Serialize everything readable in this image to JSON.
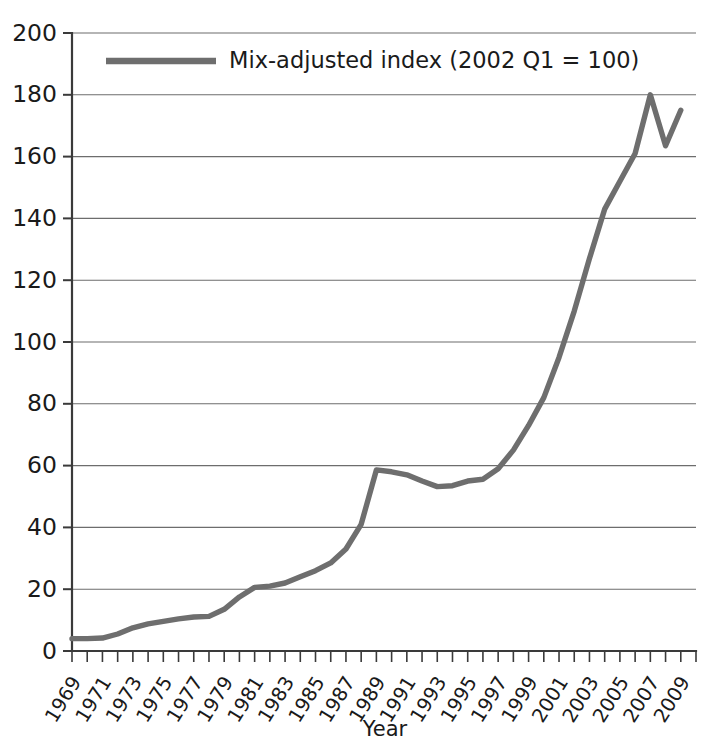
{
  "chart_data": {
    "type": "line",
    "title": "",
    "xlabel": "Year",
    "ylabel": "",
    "ylim": [
      0,
      200
    ],
    "ytick_step": 20,
    "yticks": [
      0,
      20,
      40,
      60,
      80,
      100,
      120,
      140,
      160,
      180,
      200
    ],
    "xlim": [
      1969,
      2010
    ],
    "xticks": [
      1969,
      1971,
      1973,
      1975,
      1977,
      1979,
      1981,
      1983,
      1985,
      1987,
      1989,
      1991,
      1993,
      1995,
      1997,
      1999,
      2001,
      2003,
      2005,
      2007,
      2009
    ],
    "minor_xticks_every": 1,
    "grid": "horizontal",
    "legend_position": "top-center-inside",
    "line_color": "#6e6e6e",
    "axis_color": "#3a3a3a",
    "grid_color": "#6d6d6d",
    "series": [
      {
        "name": "Mix-adjusted index (2002 Q1 = 100)",
        "x": [
          1969,
          1970,
          1971,
          1972,
          1973,
          1974,
          1975,
          1976,
          1977,
          1978,
          1979,
          1980,
          1981,
          1982,
          1983,
          1984,
          1985,
          1986,
          1987,
          1988,
          1989,
          1990,
          1991,
          1992,
          1993,
          1994,
          1995,
          1996,
          1997,
          1998,
          1999,
          2000,
          2001,
          2002,
          2003,
          2004,
          2005,
          2006,
          2007,
          2008,
          2009
        ],
        "values": [
          4,
          4,
          4.2,
          5.5,
          7.5,
          8.8,
          9.6,
          10.4,
          11,
          11.2,
          13.5,
          17.5,
          20.6,
          21,
          22,
          24,
          26,
          28.5,
          33,
          41,
          58.6,
          58,
          57,
          55,
          53.2,
          53.5,
          55,
          55.6,
          59,
          65,
          73,
          82,
          95,
          110,
          127,
          143,
          152,
          161,
          180,
          163.5,
          175
        ]
      }
    ]
  },
  "legend": {
    "entries": [
      {
        "label": "Mix-adjusted index (2002 Q1 = 100)",
        "swatch": "line-swatch",
        "color": "#6e6e6e"
      }
    ]
  },
  "axes": {
    "x_title": "Year",
    "y_title": ""
  }
}
